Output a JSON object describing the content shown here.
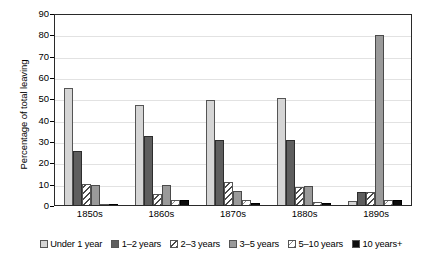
{
  "chart_data": {
    "type": "bar",
    "title": "",
    "xlabel": "",
    "ylabel": "Percentage of total leaving",
    "ylim": [
      0,
      90
    ],
    "yticks": [
      0,
      10,
      20,
      30,
      40,
      50,
      60,
      70,
      80,
      90
    ],
    "grid": true,
    "legend_position": "bottom",
    "categories": [
      "1850s",
      "1860s",
      "1870s",
      "1880s",
      "1890s"
    ],
    "series": [
      {
        "name": "Under 1 year",
        "pattern": "light-gray-solid",
        "values": [
          55,
          47,
          49,
          50,
          2
        ]
      },
      {
        "name": "1–2 years",
        "pattern": "dark-gray-solid",
        "values": [
          25.5,
          32.5,
          30.5,
          30.5,
          6
        ]
      },
      {
        "name": "2–3 years",
        "pattern": "diagonal-hatch",
        "values": [
          10,
          5,
          11,
          8.5,
          6
        ]
      },
      {
        "name": "3–5 years",
        "pattern": "medium-gray-solid",
        "values": [
          9.5,
          9.5,
          6.5,
          9,
          79.5
        ]
      },
      {
        "name": "5–10 years",
        "pattern": "light-diagonal-hatch",
        "values": [
          0.5,
          2.5,
          2.5,
          1.5,
          2.5
        ]
      },
      {
        "name": "10 years+",
        "pattern": "black-solid",
        "values": [
          0.5,
          2.5,
          1,
          1,
          2.5
        ]
      }
    ]
  },
  "axis": {
    "y_title": "Percentage of total leaving",
    "y_tick_labels": [
      "0",
      "10",
      "20",
      "30",
      "40",
      "50",
      "60",
      "70",
      "80",
      "90"
    ],
    "x_tick_labels": [
      "1850s",
      "1860s",
      "1870s",
      "1880s",
      "1890s"
    ]
  },
  "legend": {
    "items": [
      {
        "label": "Under 1 year"
      },
      {
        "label": "1–2 years"
      },
      {
        "label": "2–3 years"
      },
      {
        "label": "3–5 years"
      },
      {
        "label": "5–10 years"
      },
      {
        "label": "10 years+"
      }
    ]
  },
  "colors": {
    "under_1_year": "#d5d5d5",
    "years_1_2": "#5e5e5e",
    "years_2_3": "#4a4a4a",
    "years_3_5": "#9a9a9a",
    "years_5_10": "#8a8a8a",
    "years_10_plus": "#0d0d0d",
    "grid": "#e2e2e2",
    "frame": "#2a2a2a",
    "background": "#ffffff"
  }
}
